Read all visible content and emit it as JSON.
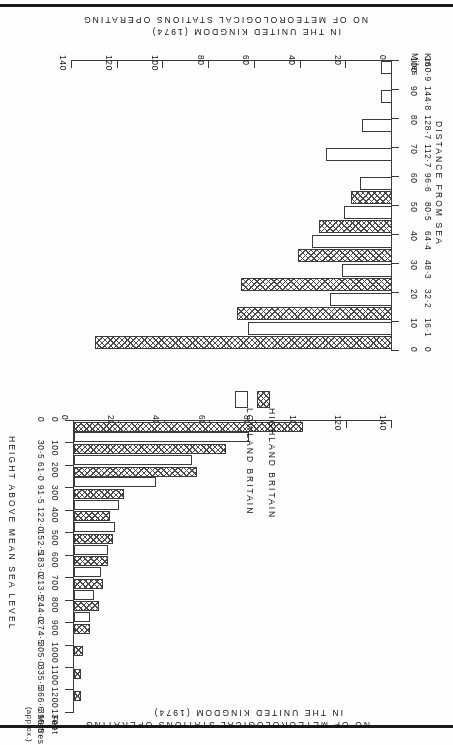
{
  "figure": {
    "orientation_note": "printed upside down",
    "shared_value_axis_title_line1": "NO OF METEOROLOGICAL STATIONS OPERATING",
    "shared_value_axis_title_line2": "IN THE UNITED KINGDOM (1974)"
  },
  "legend": {
    "items": [
      {
        "key": "hatched",
        "label": "HIGHLAND BRITAIN"
      },
      {
        "key": "open",
        "label": "LOWLAND BRITAIN"
      }
    ]
  },
  "chart_data": [
    {
      "id": "distance-from-sea",
      "type": "bar",
      "orientation": "horizontal",
      "title": "DISTANCE FROM SEA",
      "xlabel": "NO OF METEOROLOGICAL STATIONS OPERATING IN THE UNITED KINGDOM (1974)",
      "ylabel": "DISTANCE FROM SEA",
      "xlim": [
        0,
        140
      ],
      "xticks": [
        "0",
        "20",
        "40",
        "60",
        "80",
        "100",
        "120",
        "140"
      ],
      "ylim": [
        0,
        100
      ],
      "yticks_miles": [
        "0",
        "10",
        "20",
        "30",
        "40",
        "50",
        "60",
        "70",
        "80",
        "90",
        "100"
      ],
      "yticks_km": [
        "0",
        "16·1",
        "32·2",
        "48·3",
        "64·4",
        "80·5",
        "96·6",
        "112·7",
        "128·7",
        "144·8",
        "160·9"
      ],
      "unit_label_km": "Km",
      "unit_label_miles": "Miles",
      "categories": [
        "0-10",
        "10-20",
        "20-30",
        "30-40",
        "40-50",
        "50-60",
        "60-70",
        "70-80",
        "80-90",
        "90-100"
      ],
      "series": [
        {
          "name": "HIGHLAND BRITAIN",
          "values": [
            130,
            68,
            66,
            41,
            32,
            18,
            0,
            0,
            0,
            0
          ]
        },
        {
          "name": "LOWLAND BRITAIN",
          "values": [
            63,
            27,
            22,
            35,
            21,
            14,
            29,
            13,
            5,
            5
          ]
        }
      ],
      "grid": false
    },
    {
      "id": "height-above-mean-sea-level",
      "type": "bar",
      "orientation": "horizontal",
      "title": "HEIGHT ABOVE MEAN SEA LEVEL",
      "xlabel": "NO OF METEOROLOGICAL STATIONS OPERATING IN THE UNITED KINGDOM (1974)",
      "ylabel": "HEIGHT ABOVE MEAN SEA LEVEL",
      "xlim": [
        0,
        140
      ],
      "xticks": [
        "0",
        "20",
        "40",
        "60",
        "80",
        "100",
        "120",
        "140"
      ],
      "ylim": [
        0,
        1300
      ],
      "yticks_feet": [
        "0",
        "100",
        "200",
        "300",
        "400",
        "500",
        "600",
        "700",
        "800",
        "900",
        "1000",
        "1100",
        "1200",
        "1300"
      ],
      "yticks_metres": [
        "0",
        "30·5",
        "61·0",
        "91·5",
        "122·0",
        "152·5",
        "183·0",
        "213·5",
        "244·0",
        "274·5",
        "305·0",
        "335·5",
        "366·6",
        "396·5"
      ],
      "unit_label_feet": "Feet",
      "unit_label_metres": "Metres",
      "unit_label_approx": "(approx.)",
      "categories": [
        "0-100",
        "100-200",
        "200-300",
        "300-400",
        "400-500",
        "500-600",
        "600-700",
        "700-800",
        "800-900",
        "900-1000",
        "1000-1100",
        "1100-1200",
        "1200-1300"
      ],
      "series": [
        {
          "name": "HIGHLAND BRITAIN",
          "values": [
            101,
            67,
            54,
            22,
            16,
            17,
            15,
            13,
            11,
            7,
            4,
            3,
            3
          ]
        },
        {
          "name": "LOWLAND BRITAIN",
          "values": [
            77,
            52,
            36,
            20,
            18,
            15,
            12,
            9,
            7,
            0,
            0,
            0,
            0
          ]
        }
      ],
      "grid": false
    }
  ]
}
